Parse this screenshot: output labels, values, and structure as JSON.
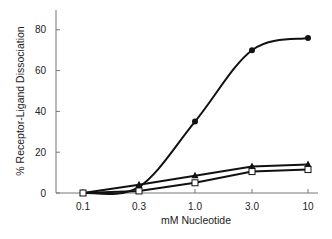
{
  "chart_data": {
    "type": "line",
    "title": "",
    "xlabel": "mM Nucleotide",
    "ylabel": "% Receptor-Ligand Dissociation",
    "x_scale": "log",
    "categories": [
      "0.1",
      "0.3",
      "1.0",
      "3.0",
      "10"
    ],
    "x": [
      0.1,
      0.3,
      1.0,
      3.0,
      10
    ],
    "ylim": [
      0,
      90
    ],
    "yticks": [
      0,
      20,
      40,
      60,
      80
    ],
    "grid": false,
    "legend": "none",
    "series": [
      {
        "name": "filled-circle",
        "marker": "circle-filled",
        "values": [
          0,
          3,
          35,
          70,
          76
        ]
      },
      {
        "name": "filled-triangle",
        "marker": "triangle-filled",
        "values": [
          0,
          4,
          8.5,
          13,
          14
        ]
      },
      {
        "name": "open-square",
        "marker": "square-open",
        "values": [
          0,
          1,
          5,
          10.5,
          11.5
        ]
      }
    ]
  }
}
